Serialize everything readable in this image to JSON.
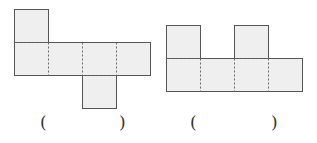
{
  "figures": [
    {
      "name": "net-1",
      "answer_blank": {
        "open": "(",
        "close": ")"
      }
    },
    {
      "name": "net-2",
      "answer_blank": {
        "open": "(",
        "close": ")"
      }
    }
  ],
  "colors": {
    "fill": "#efefef",
    "stroke": "#555555",
    "fold": "#666666"
  }
}
